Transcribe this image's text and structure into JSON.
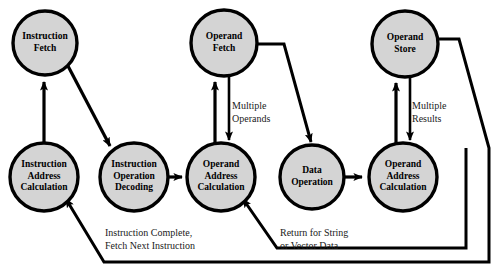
{
  "diagram": {
    "style": {
      "node_fill": "#d4d4d4",
      "node_stroke": "#000000",
      "edge_color": "#000000",
      "background": "#ffffff"
    },
    "nodes": [
      {
        "id": "instruction-fetch",
        "label": "Instruction\nFetch",
        "cx": 45,
        "cy": 43,
        "r": 32
      },
      {
        "id": "operand-fetch",
        "label": "Operand\nFetch",
        "cx": 224,
        "cy": 43,
        "r": 33
      },
      {
        "id": "operand-store",
        "label": "Operand\nStore",
        "cx": 405,
        "cy": 44,
        "r": 33
      },
      {
        "id": "instruction-address-calculation",
        "label": "Instruction\nAddress\nCalculation",
        "cx": 44,
        "cy": 177,
        "r": 34
      },
      {
        "id": "instruction-operation-decoding",
        "label": "Instruction\nOperation\nDecoding",
        "cx": 134,
        "cy": 177,
        "r": 34
      },
      {
        "id": "operand-address-calculation-1",
        "label": "Operand\nAddress\nCalculation",
        "cx": 221,
        "cy": 177,
        "r": 34
      },
      {
        "id": "data-operation",
        "label": "Data\nOperation",
        "cx": 312,
        "cy": 177,
        "r": 32
      },
      {
        "id": "operand-address-calculation-2",
        "label": "Operand\nAddress\nCalculation",
        "cx": 403,
        "cy": 177,
        "r": 34
      }
    ],
    "edge_labels": [
      {
        "id": "multiple-operands",
        "text": "Multiple\nOperands",
        "x": 232,
        "y": 99
      },
      {
        "id": "multiple-results",
        "text": "Multiple\nResults",
        "x": 412,
        "y": 99
      },
      {
        "id": "instruction-complete",
        "text": "Instruction Complete,\nFetch Next Instruction",
        "x": 105,
        "y": 227
      },
      {
        "id": "return-for-string",
        "text": "Return for String\nor Vector Data",
        "x": 280,
        "y": 227
      }
    ],
    "edges": [
      {
        "id": "instruction-address-to-instruction-fetch",
        "from": "instruction-address-calculation",
        "to": "instruction-fetch"
      },
      {
        "id": "instruction-fetch-to-decoding",
        "from": "instruction-fetch",
        "to": "instruction-operation-decoding"
      },
      {
        "id": "decoding-to-operand-address-1",
        "from": "instruction-operation-decoding",
        "to": "operand-address-calculation-1"
      },
      {
        "id": "operand-address-1-to-operand-fetch",
        "from": "operand-address-calculation-1",
        "to": "operand-fetch"
      },
      {
        "id": "operand-fetch-to-operand-address-1",
        "from": "operand-fetch",
        "to": "operand-address-calculation-1",
        "label": "multiple-operands"
      },
      {
        "id": "operand-fetch-to-data-operation",
        "from": "operand-fetch",
        "to": "data-operation"
      },
      {
        "id": "data-operation-to-operand-address-2",
        "from": "data-operation",
        "to": "operand-address-calculation-2"
      },
      {
        "id": "operand-address-2-to-operand-store",
        "from": "operand-address-calculation-2",
        "to": "operand-store"
      },
      {
        "id": "operand-store-to-operand-address-2",
        "from": "operand-store",
        "to": "operand-address-calculation-2",
        "label": "multiple-results"
      },
      {
        "id": "operand-store-to-instruction-address",
        "from": "operand-store",
        "to": "instruction-address-calculation",
        "label": "instruction-complete"
      },
      {
        "id": "operand-address-2-return-to-operand-address-1",
        "from": "operand-address-calculation-2",
        "to": "operand-address-calculation-1",
        "label": "return-for-string"
      }
    ]
  }
}
